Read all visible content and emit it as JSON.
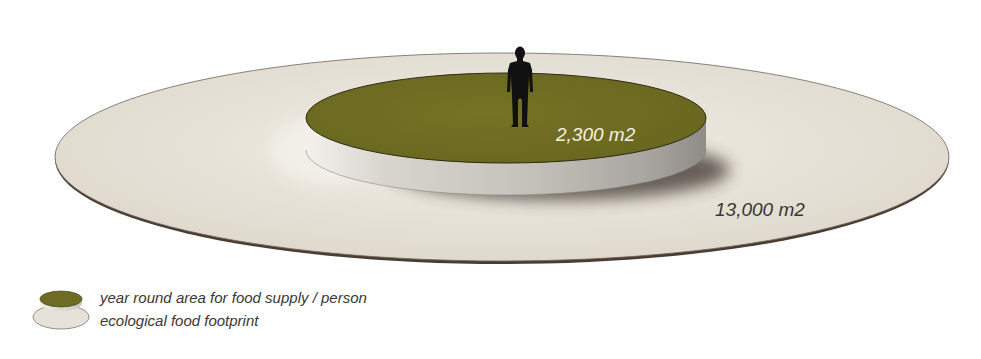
{
  "diagram": {
    "type": "scale-comparison",
    "inner_area": {
      "label": "2,300 m2",
      "value_m2": 2300,
      "color": "#6e6b22"
    },
    "outer_area": {
      "label": "13,000 m2",
      "value_m2": 13000,
      "color": "#e6e1d6"
    },
    "figure": "person-silhouette"
  },
  "legend": {
    "items": [
      {
        "label": "year round area for food supply / person",
        "color": "#6e6b22",
        "icon": "green-disc-icon"
      },
      {
        "label": "ecological food footprint",
        "color": "#e6e1d6",
        "icon": "beige-disc-icon"
      }
    ]
  }
}
